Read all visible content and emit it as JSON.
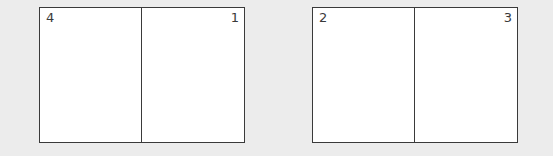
{
  "spreads": [
    {
      "pages": [
        {
          "number": "4",
          "side": "left"
        },
        {
          "number": "1",
          "side": "right"
        }
      ]
    },
    {
      "pages": [
        {
          "number": "2",
          "side": "left"
        },
        {
          "number": "3",
          "side": "right"
        }
      ]
    }
  ],
  "colors": {
    "background": "#ececec",
    "page": "#ffffff",
    "line": "#3a3a3a"
  }
}
